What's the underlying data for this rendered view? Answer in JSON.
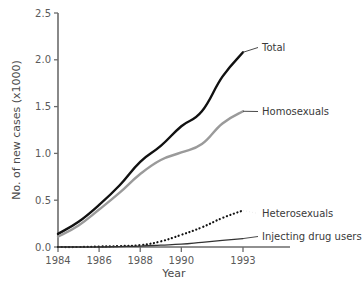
{
  "chart_data": {
    "type": "line",
    "title": "",
    "xlabel": "Year",
    "ylabel": "No. of new cases  (x1000)",
    "xlim": [
      1984,
      1993
    ],
    "ylim": [
      0.0,
      2.5
    ],
    "xticks": [
      1984,
      1986,
      1988,
      1990,
      1993
    ],
    "xtick_labels": [
      "1984",
      "1986",
      "1988",
      "1990",
      "1993"
    ],
    "yticks": [
      0.0,
      0.5,
      1.0,
      1.5,
      2.0,
      2.5
    ],
    "ytick_labels": [
      "0.0",
      "0.5",
      "1.0",
      "1.5",
      "2.0",
      "2.5"
    ],
    "grid": false,
    "legend_position": "inline-right-labels",
    "x": [
      1984,
      1985,
      1986,
      1987,
      1988,
      1989,
      1990,
      1991,
      1992,
      1993
    ],
    "series": [
      {
        "name": "Total",
        "label": "Total",
        "color": "#111111",
        "style": "solid",
        "width": 2.4,
        "values": [
          0.14,
          0.27,
          0.45,
          0.66,
          0.91,
          1.08,
          1.29,
          1.45,
          1.82,
          2.08
        ]
      },
      {
        "name": "Homosexuals",
        "label": "Homosexuals",
        "color": "#9a9a9a",
        "style": "solid",
        "width": 2.4,
        "values": [
          0.11,
          0.23,
          0.4,
          0.58,
          0.78,
          0.93,
          1.01,
          1.1,
          1.32,
          1.45
        ]
      },
      {
        "name": "Heterosexuals",
        "label": "Heterosexuals",
        "color": "#111111",
        "style": "dotted",
        "width": 2.2,
        "values": [
          0.0,
          0.0,
          0.005,
          0.01,
          0.02,
          0.06,
          0.13,
          0.21,
          0.31,
          0.39
        ]
      },
      {
        "name": "Injecting drug users",
        "label": "Injecting drug users",
        "color": "#333333",
        "style": "solid",
        "width": 1.3,
        "values": [
          0.0,
          0.0,
          0.0,
          0.005,
          0.01,
          0.02,
          0.03,
          0.05,
          0.07,
          0.09
        ]
      }
    ],
    "annotations": [
      {
        "text": "Total",
        "x": 1993,
        "y": 2.08
      },
      {
        "text": "Homosexuals",
        "x": 1993,
        "y": 1.45
      },
      {
        "text": "Heterosexuals",
        "x": 1993,
        "y": 0.39
      },
      {
        "text": "Injecting drug users",
        "x": 1993,
        "y": 0.09
      }
    ]
  }
}
